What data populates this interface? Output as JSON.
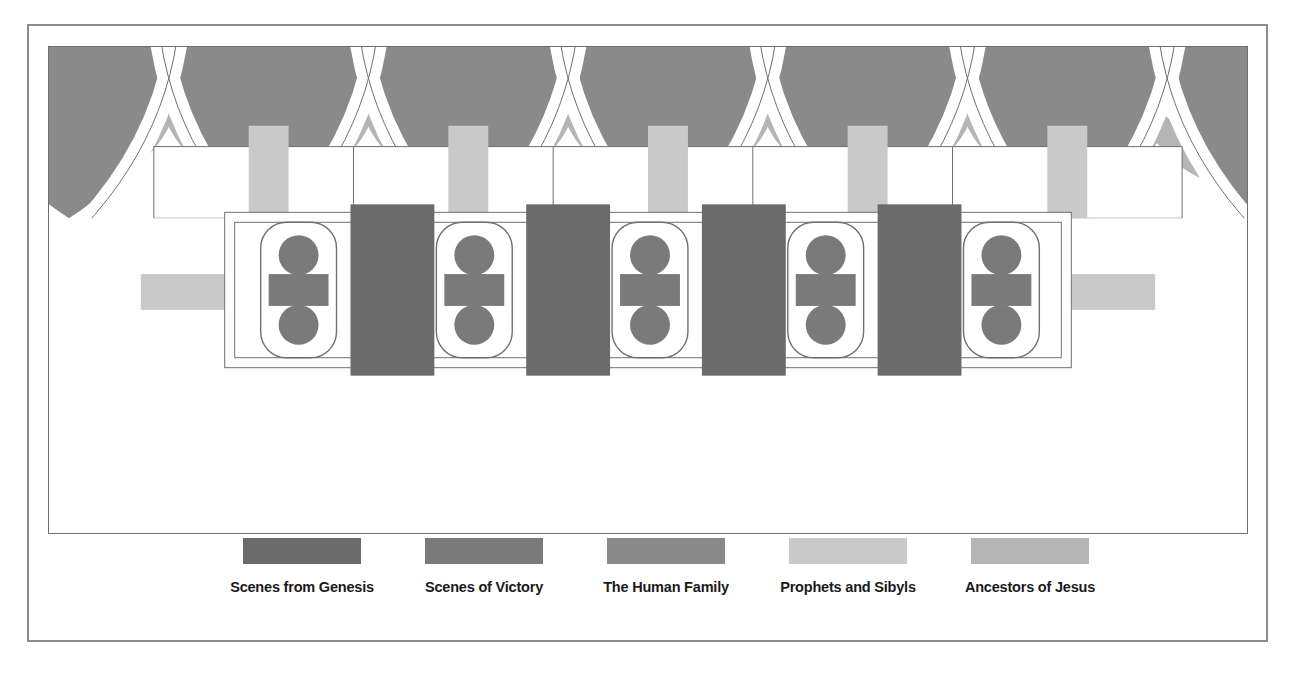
{
  "colors": {
    "genesis": "#6b6b6b",
    "victory": "#7a7a7a",
    "human_family": "#8a8a8a",
    "prophets_sibyls": "#c9c9c9",
    "ancestors": "#b5b5b5",
    "outline": "#6f6f6f",
    "frame": "#8c8c8c",
    "background": "#ffffff",
    "text": "#1a1a1a"
  },
  "legend": {
    "items": [
      {
        "label": "Scenes from Genesis",
        "color_key": "genesis",
        "color": "#6b6b6b"
      },
      {
        "label": "Scenes of Victory",
        "color_key": "victory",
        "color": "#7a7a7a"
      },
      {
        "label": "The Human Family",
        "color_key": "human_family",
        "color": "#8a8a8a"
      },
      {
        "label": "Prophets and Sibyls",
        "color_key": "prophets_sibyls",
        "color": "#c9c9c9"
      },
      {
        "label": "Ancestors of Jesus",
        "color_key": "ancestors",
        "color": "#b5b5b5"
      }
    ]
  },
  "plan": {
    "bays": 6,
    "central_panels": {
      "genesis_count": 4,
      "victory_count": 5,
      "medallion_per_victory": 2
    },
    "top_row": {
      "lunettes": 6,
      "spandrels": 6,
      "pilaster_bars": 5
    },
    "bottom_row": {
      "lunettes": 6,
      "spandrels": 6,
      "pilaster_bars": 5
    },
    "side_bars": {
      "left": 1,
      "right": 1
    }
  }
}
